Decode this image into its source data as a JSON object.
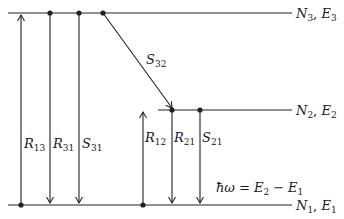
{
  "diagram": {
    "levels": [
      {
        "id": "N3",
        "label": "N",
        "label_sub": "3",
        "energy": "E",
        "energy_sub": "3",
        "y": 13
      },
      {
        "id": "N2",
        "label": "N",
        "label_sub": "2",
        "energy": "E",
        "energy_sub": "2",
        "y": 110
      },
      {
        "id": "N1",
        "label": "N",
        "label_sub": "1",
        "energy": "E",
        "energy_sub": "1",
        "y": 205
      }
    ],
    "transitions": [
      {
        "name": "R",
        "sub": "13",
        "direction": "up",
        "from": "N1",
        "to": "N3"
      },
      {
        "name": "R",
        "sub": "31",
        "direction": "down",
        "from": "N3",
        "to": "N1"
      },
      {
        "name": "S",
        "sub": "31",
        "direction": "down",
        "from": "N3",
        "to": "N1"
      },
      {
        "name": "S",
        "sub": "32",
        "direction": "diagonal-down",
        "from": "N3",
        "to": "N2"
      },
      {
        "name": "R",
        "sub": "12",
        "direction": "up",
        "from": "N1",
        "to": "N2"
      },
      {
        "name": "R",
        "sub": "21",
        "direction": "down",
        "from": "N2",
        "to": "N1"
      },
      {
        "name": "S",
        "sub": "21",
        "direction": "down",
        "from": "N2",
        "to": "N1"
      }
    ],
    "equation": {
      "lhs": "ħω",
      "eq": "=",
      "t1": "E",
      "t1_sub": "2",
      "minus": "−",
      "t2": "E",
      "t2_sub": "1"
    },
    "separator": ", "
  }
}
